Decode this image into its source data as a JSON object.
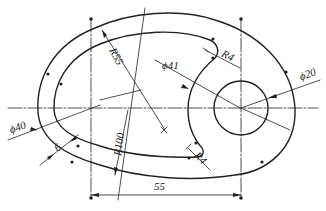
{
  "drawing": {
    "type": "engineering-drawing",
    "subject": "cam / eccentric plate profile with offset groove",
    "colors": {
      "line": "#222222",
      "background": "#ffffff"
    },
    "dimensions": {
      "r55": "R55",
      "r100": "R100",
      "r4_top": "R4",
      "r4_bottom": "R4",
      "phi41": "ϕ41",
      "phi20": "ϕ20",
      "phi40": "ϕ40",
      "width6": "6",
      "center_distance": "55"
    }
  }
}
